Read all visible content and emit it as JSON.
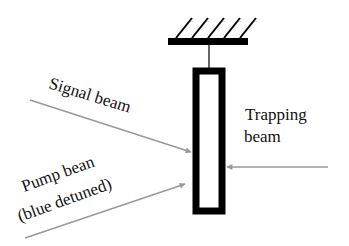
{
  "labels": {
    "signal": "Signal beam",
    "pump_line1": "Pump bean",
    "pump_line2": "(blue detuned)",
    "trapping_line1": "Trapping",
    "trapping_line2": "beam"
  },
  "colors": {
    "structure": "#000000",
    "arrow": "#999999",
    "text": "#111111",
    "background": "#ffffff"
  }
}
